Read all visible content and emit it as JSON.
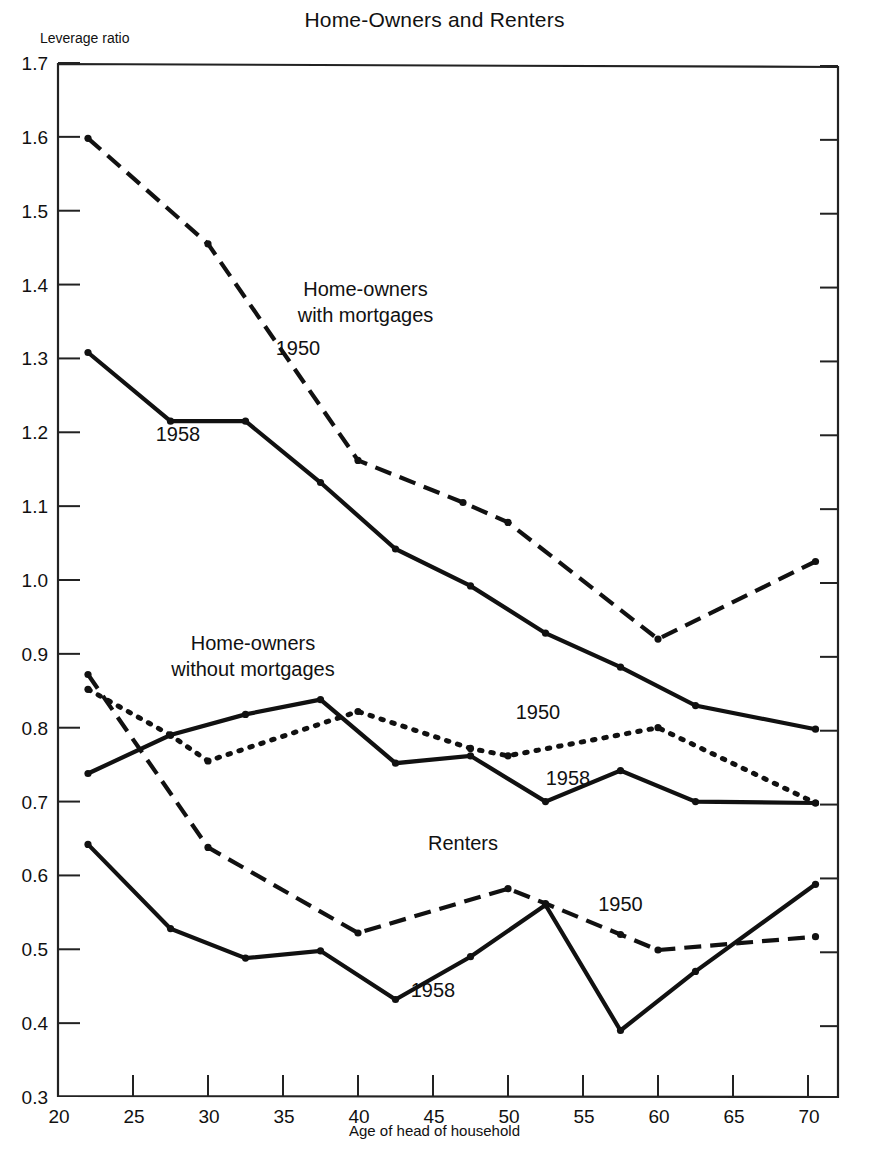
{
  "chart_data": {
    "type": "line",
    "title": "Home-Owners and Renters",
    "xlabel": "Age of head of household",
    "ylabel": "Leverage ratio",
    "xlim": [
      20,
      72
    ],
    "ylim": [
      0.3,
      1.7
    ],
    "xticks": [
      20,
      25,
      30,
      35,
      40,
      45,
      50,
      55,
      60,
      65,
      70
    ],
    "yticks": [
      "0.3",
      "0.4",
      "0.5",
      "0.6",
      "0.7",
      "0.8",
      "0.9",
      "1.0",
      "1.1",
      "1.2",
      "1.3",
      "1.4",
      "1.5",
      "1.6",
      "1.7"
    ],
    "grid": false,
    "legend_position": "inline-annotations",
    "group_labels": [
      {
        "text_line1": "Home-owners",
        "text_line2": "with mortgages",
        "x": 40.5,
        "y": 1.385
      },
      {
        "text_line1": "Home-owners",
        "text_line2": "without mortgages",
        "x": 33.0,
        "y": 0.905
      },
      {
        "text_line1": "Renters",
        "text_line2": "",
        "x": 47.0,
        "y": 0.635
      }
    ],
    "series": [
      {
        "name": "Home-owners with mortgages, 1950",
        "group": "Home-owners with mortgages",
        "year": "1950",
        "style": "dashed",
        "label_x": 36.0,
        "label_y": 1.305,
        "x": [
          22,
          30,
          40,
          47,
          50,
          60,
          70.5
        ],
        "values": [
          1.598,
          1.455,
          1.162,
          1.105,
          1.078,
          0.92,
          1.025
        ]
      },
      {
        "name": "Home-owners with mortgages, 1958",
        "group": "Home-owners with mortgages",
        "year": "1958",
        "style": "solid",
        "label_x": 28.0,
        "label_y": 1.188,
        "x": [
          22,
          27.5,
          32.5,
          37.5,
          42.5,
          47.5,
          52.5,
          57.5,
          62.5,
          70.5
        ],
        "values": [
          1.308,
          1.215,
          1.215,
          1.132,
          1.042,
          0.992,
          0.928,
          0.882,
          0.83,
          0.798
        ]
      },
      {
        "name": "Home-owners without mortgages, 1950",
        "group": "Home-owners without mortgages",
        "year": "1950",
        "style": "dotted",
        "label_x": 52.0,
        "label_y": 0.812,
        "x": [
          22,
          27.5,
          30,
          40,
          47.5,
          50,
          60,
          70.5
        ],
        "values": [
          0.852,
          0.79,
          0.755,
          0.822,
          0.772,
          0.762,
          0.8,
          0.698
        ]
      },
      {
        "name": "Home-owners without mortgages, 1958",
        "group": "Home-owners without mortgages",
        "year": "1958",
        "style": "solid",
        "label_x": 54.0,
        "label_y": 0.722,
        "x": [
          22,
          27.5,
          32.5,
          37.5,
          42.5,
          47.5,
          52.5,
          57.5,
          62.5,
          70.5
        ],
        "values": [
          0.738,
          0.79,
          0.818,
          0.838,
          0.752,
          0.762,
          0.7,
          0.742,
          0.7,
          0.698
        ]
      },
      {
        "name": "Renters, 1950",
        "group": "Renters",
        "year": "1950",
        "style": "dashed",
        "label_x": 57.5,
        "label_y": 0.552,
        "x": [
          22,
          30,
          40,
          50,
          52.5,
          57.5,
          60,
          70.5
        ],
        "values": [
          0.872,
          0.638,
          0.522,
          0.582,
          0.562,
          0.52,
          0.499,
          0.517
        ]
      },
      {
        "name": "Renters, 1958",
        "group": "Renters",
        "year": "1958",
        "style": "solid",
        "label_x": 45.0,
        "label_y": 0.435,
        "x": [
          22,
          27.5,
          32.5,
          37.5,
          42.5,
          47.5,
          52.5,
          57.5,
          62.5,
          70.5
        ],
        "values": [
          0.642,
          0.528,
          0.488,
          0.498,
          0.432,
          0.49,
          0.56,
          0.39,
          0.47,
          0.588
        ]
      }
    ]
  },
  "colors": {
    "line": "#111111",
    "axis": "#222222",
    "background": "#ffffff"
  },
  "caption": ""
}
